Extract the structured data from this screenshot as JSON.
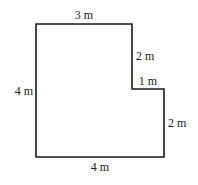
{
  "figure": {
    "type": "L-shaped floor plan (rectilinear polygon with notch)",
    "stroke_color": "#1a1a1a",
    "background": "#ffffff",
    "vertices": [
      [
        36,
        24
      ],
      [
        132,
        24
      ],
      [
        132,
        89
      ],
      [
        164,
        89
      ],
      [
        164,
        157
      ],
      [
        36,
        157
      ]
    ],
    "labels": {
      "top": "3 m",
      "notch_vertical": "2 m",
      "notch_horizontal": "1 m",
      "left": "4 m",
      "right": "2 m",
      "bottom": "4 m"
    }
  }
}
